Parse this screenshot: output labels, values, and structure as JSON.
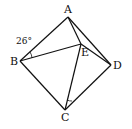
{
  "diagram": {
    "points": {
      "A": {
        "label": "A",
        "x": 68,
        "y": 17
      },
      "B": {
        "label": "B",
        "x": 20,
        "y": 61
      },
      "C": {
        "label": "C",
        "x": 65,
        "y": 110
      },
      "D": {
        "label": "D",
        "x": 111,
        "y": 65
      },
      "E": {
        "label": "E",
        "x": 81,
        "y": 44
      }
    },
    "segments": [
      "AB",
      "BC",
      "CD",
      "DA",
      "AE",
      "ED",
      "BE",
      "CE"
    ],
    "angle_label": "26°",
    "line_color": "#111111"
  }
}
